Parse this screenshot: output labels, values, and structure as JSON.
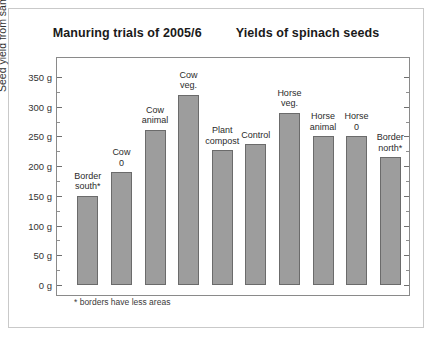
{
  "titles": {
    "left": "Manuring trials of 2005/6",
    "right": "Yields of spinach seeds"
  },
  "footnote": "* borders have less areas",
  "axis": {
    "ylabel": "Seed yield from same areas",
    "tick_labels": [
      "350 g",
      "300 g",
      "250 g",
      "200 g",
      "150 g",
      "100 g",
      "50 g",
      "0 g"
    ]
  },
  "colors": {
    "bar_fill": "#9d9d9d",
    "bar_border": "#6b6b6b",
    "frame": "#8a8a8a",
    "page_border": "#c9c9c9",
    "text": "#1a1a1a"
  },
  "chart_data": {
    "type": "bar",
    "title": "Manuring trials of 2005/6    Yields of spinach seeds",
    "xlabel": "",
    "ylabel": "Seed yield from same areas",
    "ylim": [
      0,
      350
    ],
    "ytick_step": 50,
    "yminor_step": 25,
    "yunit": "g",
    "grid": false,
    "legend": null,
    "annotation": "* borders have less areas",
    "categories": [
      "Border south*",
      "Cow 0",
      "Cow animal",
      "Cow veg.",
      "Plant compost",
      "Control",
      "Horse veg.",
      "Horse animal",
      "Horse 0",
      "Border north*"
    ],
    "category_labels": [
      "Border\nsouth*",
      "Cow\n0",
      "Cow\nanimal",
      "Cow\nveg.",
      "Plant\ncompost",
      "Control",
      "Horse\nveg.",
      "Horse\nanimal",
      "Horse\n0",
      "Border\nnorth*"
    ],
    "values": [
      150,
      190,
      261,
      320,
      227,
      237,
      290,
      250,
      250,
      215
    ]
  }
}
